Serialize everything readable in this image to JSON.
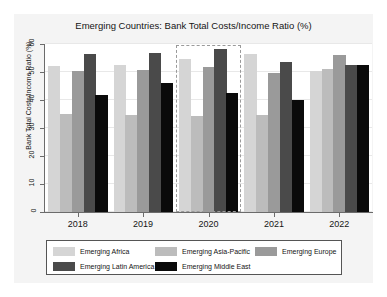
{
  "chart_data": {
    "type": "bar",
    "title": "Emerging Countries: Bank Total Costs/Income Ratio (%)",
    "xlabel": "",
    "ylabel": "Bank Total Costs/Income Ratio (%)",
    "categories": [
      "2018",
      "2019",
      "2020",
      "2021",
      "2022"
    ],
    "ylim": [
      0,
      60
    ],
    "yticks": [
      0,
      10,
      20,
      30,
      40,
      50,
      60
    ],
    "ytick_labels": [
      "0",
      "10",
      "20",
      "30",
      "40",
      "50",
      "60"
    ],
    "grid": true,
    "legend_position": "bottom",
    "highlight": {
      "category": "2020",
      "style": "dashed-box",
      "color": "#9a9a9a"
    },
    "series": [
      {
        "name": "Emerging Africa",
        "color": "#d5d5d5",
        "values": [
          52.2,
          52.6,
          54.8,
          56.3,
          50.4
        ]
      },
      {
        "name": "Emerging Asia-Pacific",
        "color": "#bcbcbc",
        "values": [
          34.9,
          34.6,
          34.2,
          34.7,
          51.1
        ]
      },
      {
        "name": "Emerging Europe",
        "color": "#9a9a9a",
        "values": [
          50.2,
          50.7,
          51.8,
          49.6,
          56.1
        ]
      },
      {
        "name": "Emerging Latin America",
        "color": "#4a4a4a",
        "values": [
          56.3,
          56.9,
          58.2,
          53.7,
          52.4
        ]
      },
      {
        "name": "Emerging Middle East",
        "color": "#0a0a0a",
        "values": [
          41.8,
          46.1,
          42.5,
          40.0,
          52.6
        ]
      }
    ]
  }
}
